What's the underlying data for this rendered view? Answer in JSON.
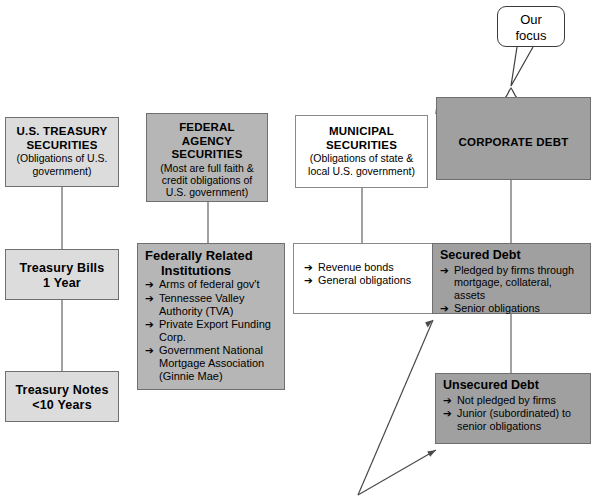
{
  "diagram": {
    "callout": {
      "line1": "Our",
      "line2": "focus"
    },
    "bullet_glyph": "➔",
    "colors": {
      "light_gray": "#dcdcdc",
      "mid_gray": "#b6b6b6",
      "dark_gray": "#a0a0a0",
      "white": "#ffffff",
      "border": "#8a8a8a",
      "text": "#000000"
    },
    "columns": [
      {
        "key": "us_treasury",
        "top": {
          "title_line1": "U.S. TREASURY",
          "title_line2": "SECURITIES",
          "sub_line1": "(Obligations of U.S.",
          "sub_line2": "government)"
        },
        "children": [
          {
            "title_line1": "Treasury Bills",
            "title_line2": "1 Year"
          },
          {
            "title_line1": "Treasury Notes",
            "title_line2": "<10 Years"
          }
        ]
      },
      {
        "key": "federal_agency",
        "top": {
          "title_line1": "FEDERAL AGENCY",
          "title_line2": "SECURITIES",
          "sub_line1": "(Most are full faith &",
          "sub_line2": "credit obligations of",
          "sub_line3": "U.S. government)"
        },
        "children": [
          {
            "header_line1": "Federally Related",
            "header_line2": "Institutions",
            "bullets": [
              "Arms of federal gov't",
              "Tennessee Valley Authority (TVA)",
              "Private Export Funding Corp.",
              "Government National Mortgage Association (Ginnie Mae)"
            ]
          }
        ]
      },
      {
        "key": "municipal",
        "top": {
          "title_line1": "MUNICIPAL",
          "title_line2": "SECURITIES",
          "sub_line1": "(Obligations of state &",
          "sub_line2": "local U.S. government)"
        },
        "children": [
          {
            "bullets": [
              "Revenue bonds",
              "General obligations"
            ]
          }
        ]
      },
      {
        "key": "corporate_debt",
        "top": {
          "title_line1": "CORPORATE DEBT"
        },
        "children": [
          {
            "title": "Secured Debt",
            "bullets": [
              "Pledged by firms through mortgage, collateral, assets",
              "Senior obligations"
            ]
          },
          {
            "title": "Unsecured Debt",
            "bullets": [
              "Not pledged by firms",
              "Junior (subordinated) to senior obligations"
            ]
          }
        ]
      }
    ]
  }
}
